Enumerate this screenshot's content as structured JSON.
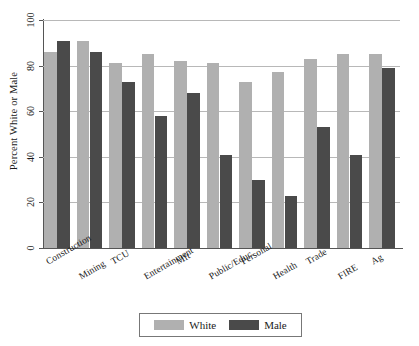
{
  "chart_data": {
    "type": "bar",
    "title": "",
    "xlabel": "",
    "ylabel": "Percent White or Male",
    "ylim": [
      0,
      100
    ],
    "yticks": [
      0,
      20,
      40,
      60,
      80,
      100
    ],
    "grid": true,
    "legend_position": "bottom-center",
    "categories": [
      "Construction",
      "Mining",
      "TCU",
      "Entertainment",
      "Mft",
      "Public/Educ.",
      "Personal",
      "Health",
      "Trade",
      "FIRE",
      "Ag"
    ],
    "series": [
      {
        "name": "White",
        "color": "#b0b0b0",
        "values": [
          86,
          91,
          81,
          85,
          82,
          81,
          73,
          77,
          83,
          85,
          85
        ]
      },
      {
        "name": "Male",
        "color": "#4a4a4a",
        "values": [
          91,
          86,
          73,
          58,
          68,
          41,
          30,
          23,
          53,
          41,
          79
        ]
      }
    ]
  },
  "legend": {
    "items": [
      {
        "label": "White",
        "swatch": "white"
      },
      {
        "label": "Male",
        "swatch": "male"
      }
    ]
  }
}
